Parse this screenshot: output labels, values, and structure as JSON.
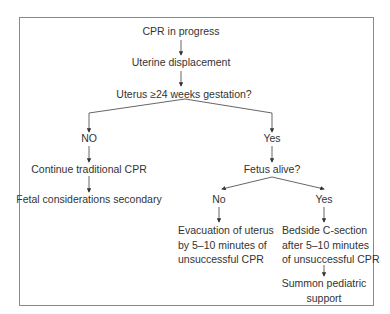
{
  "diagram": {
    "type": "flowchart",
    "nodes": {
      "start": "CPR in progress",
      "displacement": "Uterine displacement",
      "question_gestation": "Uterus ≥24 weeks gestation?",
      "no_branch": "NO",
      "yes_branch": "Yes",
      "continue_cpr": "Continue traditional CPR",
      "fetal_secondary": "Fetal considerations secondary",
      "question_fetus": "Fetus alive?",
      "fetus_no": "No",
      "fetus_yes": "Yes",
      "evacuation": [
        "Evacuation of uterus",
        "by 5–10 minutes of",
        "unsuccessful CPR"
      ],
      "csection": [
        "Bedside C-section",
        "after 5–10 minutes",
        "of unsuccessful CPR"
      ],
      "pediatric": [
        "Summon pediatric",
        "support"
      ]
    },
    "edges": [
      [
        "start",
        "displacement"
      ],
      [
        "displacement",
        "question_gestation"
      ],
      [
        "question_gestation",
        "no_branch"
      ],
      [
        "question_gestation",
        "yes_branch"
      ],
      [
        "no_branch",
        "continue_cpr"
      ],
      [
        "continue_cpr",
        "fetal_secondary"
      ],
      [
        "yes_branch",
        "question_fetus"
      ],
      [
        "question_fetus",
        "fetus_no"
      ],
      [
        "question_fetus",
        "fetus_yes"
      ],
      [
        "fetus_no",
        "evacuation"
      ],
      [
        "fetus_yes",
        "csection"
      ],
      [
        "csection",
        "pediatric"
      ]
    ],
    "colors": {
      "line": "#444444",
      "frame": "#8a8a8a",
      "text": "#333333"
    }
  }
}
